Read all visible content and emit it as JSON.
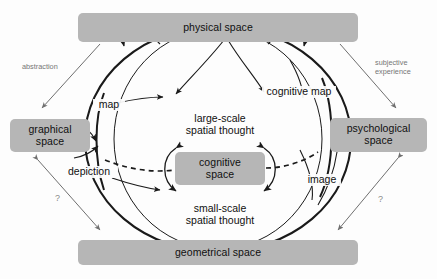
{
  "figure": {
    "title_implicit": "",
    "background_color": "#fdfdfd",
    "box_fill_color": "#b6b6b6",
    "stroke_color": "#1a1a1a",
    "muted_label_color": "#767676"
  },
  "nodes": [
    {
      "id": "physical",
      "label": "physical space",
      "x": 78,
      "y": 13,
      "w": 280,
      "h": 29
    },
    {
      "id": "graphical",
      "label": "graphical\nspace",
      "x": 10,
      "y": 119,
      "w": 80,
      "h": 33
    },
    {
      "id": "psychological",
      "label": "psychological\nspace",
      "x": 330,
      "y": 118,
      "w": 97,
      "h": 34
    },
    {
      "id": "geometrical",
      "label": "geometrical space",
      "x": 78,
      "y": 240,
      "w": 280,
      "h": 25
    },
    {
      "id": "cognitive",
      "label": "cognitive\nspace",
      "x": 175,
      "y": 152,
      "w": 90,
      "h": 33
    }
  ],
  "core_labels": [
    {
      "id": "large-scale",
      "label": "large-scale\nspatial thought",
      "x": 170,
      "y": 112
    },
    {
      "id": "small-scale",
      "label": "small-scale\nspatial thought",
      "x": 170,
      "y": 202
    }
  ],
  "arc_labels": [
    {
      "id": "map",
      "label": "map",
      "x": 93,
      "y": 99
    },
    {
      "id": "depiction",
      "label": "depiction",
      "x": 71,
      "y": 166
    },
    {
      "id": "cognitive-map",
      "label": "cognitive map",
      "x": 264,
      "y": 86
    },
    {
      "id": "image",
      "label": "image",
      "x": 303,
      "y": 174
    }
  ],
  "side_labels": [
    {
      "id": "abstraction",
      "label": "abstraction",
      "x": 22,
      "y": 63
    },
    {
      "id": "subjective-experience",
      "label": "subjective\nexperience",
      "x": 375,
      "y": 60
    }
  ],
  "question_marks": [
    {
      "id": "question-left",
      "label": "?",
      "x": 55,
      "y": 196
    },
    {
      "id": "question-right",
      "label": "?",
      "x": 378,
      "y": 197
    }
  ],
  "connectors": {
    "abstraction_arrow": "physical space → graphical space",
    "subjective_arrow": "physical space → psychological space",
    "left_question_arrow": "graphical space ↔ geometrical space",
    "right_question_arrow": "psychological space ↔ geometrical space"
  }
}
